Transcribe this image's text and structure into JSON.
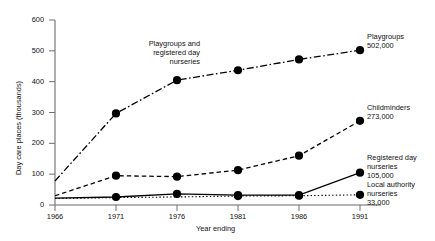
{
  "chart_data": {
    "type": "line",
    "title": "",
    "xlabel": "Year ending",
    "ylabel": "Day care places (thousands)",
    "x": [
      1966,
      1971,
      1976,
      1981,
      1986,
      1991
    ],
    "xtick_labels": [
      "1966",
      "1971",
      "1976",
      "1981",
      "1986",
      "1991"
    ],
    "ytick_labels": [
      "0",
      "100",
      "200",
      "300",
      "400",
      "500",
      "600"
    ],
    "yticks": [
      0,
      100,
      200,
      300,
      400,
      500,
      600
    ],
    "ylim": [
      0,
      600
    ],
    "xlim": [
      1966,
      1991
    ],
    "grid": false,
    "legend": "inline-right-labels",
    "series": [
      {
        "name": "Playgroups",
        "style": "dash-dot",
        "annotation_in_chart": "Playgroups and\nregistered day\nnurseries",
        "end_label": "Playgroups",
        "end_value_label": "502,000",
        "x": [
          1966,
          1971,
          1976,
          1981,
          1986,
          1991
        ],
        "values": [
          78,
          297,
          405,
          437,
          472,
          502
        ],
        "markers": [
          false,
          true,
          true,
          true,
          true,
          true
        ]
      },
      {
        "name": "Childminders",
        "style": "dashed",
        "end_label": "Childminders",
        "end_value_label": "273,000",
        "x": [
          1966,
          1971,
          1976,
          1981,
          1986,
          1991
        ],
        "values": [
          30,
          95,
          92,
          113,
          160,
          273
        ],
        "markers": [
          false,
          true,
          true,
          true,
          true,
          true
        ]
      },
      {
        "name": "Registered day nurseries",
        "style": "solid",
        "end_label": "Registered day\nnurseries",
        "end_value_label": "105,000",
        "x": [
          1966,
          1971,
          1976,
          1981,
          1986,
          1991
        ],
        "values": [
          22,
          26,
          36,
          32,
          32,
          105
        ],
        "markers": [
          false,
          true,
          true,
          true,
          true,
          true
        ]
      },
      {
        "name": "Local authority nurseries",
        "style": "dotted",
        "end_label": "Local authority\nnurseries",
        "end_value_label": "33,000",
        "x": [
          1966,
          1971,
          1976,
          1981,
          1986,
          1991
        ],
        "values": [
          21,
          24,
          26,
          29,
          30,
          33
        ],
        "markers": [
          false,
          false,
          false,
          true,
          true,
          true
        ]
      }
    ]
  },
  "annotations": {
    "in_chart_playgroups": [
      "Playgroups and",
      "registered day",
      "nurseries"
    ],
    "playgroups_label": "Playgroups",
    "playgroups_value": "502,000",
    "childminders_label": "Childminders",
    "childminders_value": "273,000",
    "registered_label_1": "Registered day",
    "registered_label_2": "nurseries",
    "registered_value": "105,000",
    "local_label_1": "Local authority",
    "local_label_2": "nurseries",
    "local_value": "33,000"
  },
  "axes": {
    "y_title": "Day care places (thousands)",
    "x_title": "Year ending",
    "y_labels": [
      "600",
      "500",
      "400",
      "300",
      "200",
      "100",
      "0"
    ],
    "x_labels": [
      "1966",
      "1971",
      "1976",
      "1981",
      "1986",
      "1991"
    ]
  }
}
